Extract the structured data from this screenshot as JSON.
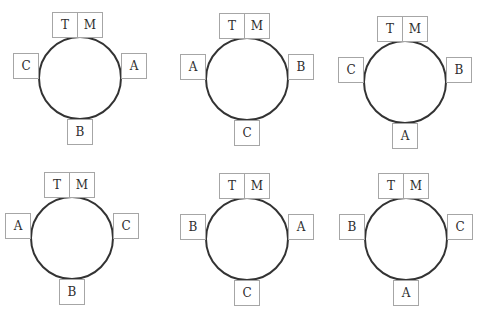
{
  "diagrams": [
    {
      "top_left": "T",
      "top_right": "M",
      "left": "C",
      "right": "A",
      "bottom": "B"
    },
    {
      "top_left": "T",
      "top_right": "M",
      "left": "A",
      "right": "B",
      "bottom": "C"
    },
    {
      "top_left": "T",
      "top_right": "M",
      "left": "C",
      "right": "B",
      "bottom": "A"
    },
    {
      "top_left": "T",
      "top_right": "M",
      "left": "A",
      "right": "C",
      "bottom": "B"
    },
    {
      "top_left": "T",
      "top_right": "M",
      "left": "B",
      "right": "A",
      "bottom": "C"
    },
    {
      "top_left": "T",
      "top_right": "M",
      "left": "B",
      "right": "C",
      "bottom": "A"
    }
  ],
  "colors": {
    "table_stroke": "#333333",
    "seat_border": "#a6a6a6",
    "label_text": "#2e2e2e",
    "background": "#ffffff"
  }
}
